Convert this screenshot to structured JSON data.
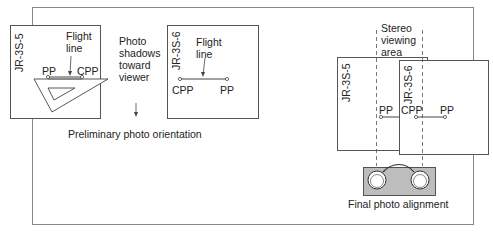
{
  "preliminary": {
    "photo_left": {
      "id": "JR-3S-5",
      "pp": "PP",
      "cpp": "CPP",
      "flight_line": [
        "Flight",
        "line"
      ]
    },
    "photo_right": {
      "id": "JR-3S-6",
      "pp": "PP",
      "cpp": "CPP",
      "flight_line": [
        "Flight",
        "line"
      ]
    },
    "shadow_note": [
      "Photo",
      "shadows",
      "toward",
      "viewer"
    ],
    "caption": "Preliminary photo orientation"
  },
  "final": {
    "stereo_area": [
      "Stereo",
      "viewing",
      "area"
    ],
    "photo_left": {
      "id": "JR-3S-5",
      "pp": "PP"
    },
    "photo_right": {
      "id": "JR-3S-6",
      "cpp": "CPP",
      "pp": "PP"
    },
    "caption": "Final photo alignment"
  },
  "colors": {
    "line": "#444444",
    "frame": "#888888",
    "stereoscope_fill": "#bdbdbd"
  }
}
